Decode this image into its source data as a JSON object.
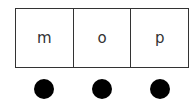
{
  "cells": [
    {
      "label": "m"
    },
    {
      "label": "o"
    },
    {
      "label": "p"
    }
  ],
  "markers": [
    {
      "type": "filled-circle",
      "color": "#000000"
    },
    {
      "type": "filled-circle",
      "color": "#000000"
    },
    {
      "type": "filled-circle",
      "color": "#000000"
    }
  ]
}
